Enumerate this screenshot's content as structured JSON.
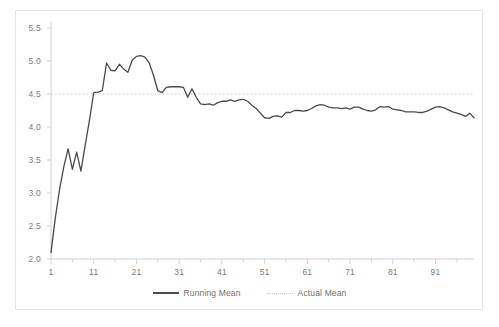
{
  "chart_data": {
    "type": "line",
    "title": "",
    "xlabel": "",
    "ylabel": "",
    "xlim": [
      1,
      100
    ],
    "ylim": [
      2.0,
      5.5
    ],
    "grid": false,
    "legend_position": "bottom",
    "y_ticks": [
      "2.0",
      "2.5",
      "3.0",
      "3.5",
      "4.0",
      "4.5",
      "5.0",
      "5.5"
    ],
    "y_tick_values": [
      2.0,
      2.5,
      3.0,
      3.5,
      4.0,
      4.5,
      5.0,
      5.5
    ],
    "x_ticks": [
      "1",
      "11",
      "21",
      "31",
      "41",
      "51",
      "61",
      "71",
      "81",
      "91"
    ],
    "x_tick_values": [
      1,
      11,
      21,
      31,
      41,
      51,
      61,
      71,
      81,
      91
    ],
    "series": [
      {
        "name": "Running Mean",
        "style": "solid",
        "color": "#4a4a4a",
        "x": [
          1,
          2,
          3,
          4,
          5,
          6,
          7,
          8,
          9,
          10,
          11,
          12,
          13,
          14,
          15,
          16,
          17,
          18,
          19,
          20,
          21,
          22,
          23,
          24,
          25,
          26,
          27,
          28,
          29,
          30,
          31,
          32,
          33,
          34,
          35,
          36,
          37,
          38,
          39,
          40,
          41,
          42,
          43,
          44,
          45,
          46,
          47,
          48,
          49,
          50,
          51,
          52,
          53,
          54,
          55,
          56,
          57,
          58,
          59,
          60,
          61,
          62,
          63,
          64,
          65,
          66,
          67,
          68,
          69,
          70,
          71,
          72,
          73,
          74,
          75,
          76,
          77,
          78,
          79,
          80,
          81,
          82,
          83,
          84,
          85,
          86,
          87,
          88,
          89,
          90,
          91,
          92,
          93,
          94,
          95,
          96,
          97,
          98,
          99,
          100
        ],
        "values": [
          2.1,
          2.62,
          3.05,
          3.4,
          3.67,
          3.36,
          3.62,
          3.33,
          3.72,
          4.1,
          4.52,
          4.53,
          4.55,
          4.97,
          4.86,
          4.85,
          4.95,
          4.88,
          4.83,
          5.01,
          5.07,
          5.08,
          5.06,
          4.97,
          4.78,
          4.55,
          4.52,
          4.6,
          4.61,
          4.61,
          4.61,
          4.6,
          4.45,
          4.58,
          4.45,
          4.35,
          4.34,
          4.35,
          4.33,
          4.37,
          4.39,
          4.39,
          4.41,
          4.39,
          4.41,
          4.42,
          4.39,
          4.33,
          4.28,
          4.21,
          4.14,
          4.13,
          4.16,
          4.17,
          4.15,
          4.22,
          4.22,
          4.25,
          4.25,
          4.24,
          4.25,
          4.28,
          4.32,
          4.34,
          4.33,
          4.3,
          4.29,
          4.29,
          4.28,
          4.29,
          4.27,
          4.3,
          4.3,
          4.27,
          4.25,
          4.24,
          4.26,
          4.31,
          4.3,
          4.31,
          4.27,
          4.26,
          4.25,
          4.23,
          4.23,
          4.23,
          4.22,
          4.22,
          4.24,
          4.27,
          4.3,
          4.31,
          4.29,
          4.26,
          4.23,
          4.21,
          4.19,
          4.16,
          4.21,
          4.14
        ]
      },
      {
        "name": "Actual Mean",
        "style": "dotted",
        "color": "#c9c9c9",
        "constant_value": 4.5
      }
    ]
  },
  "legend": {
    "entries": [
      {
        "label": "Running Mean"
      },
      {
        "label": "Actual Mean"
      }
    ]
  },
  "colors": {
    "series_line": "#4a4a4a",
    "reference_line": "#c9c9c9",
    "axis": "#d0d0d0",
    "tick_text": "#7b7b7b",
    "frame_border": "#e3e3e3"
  }
}
